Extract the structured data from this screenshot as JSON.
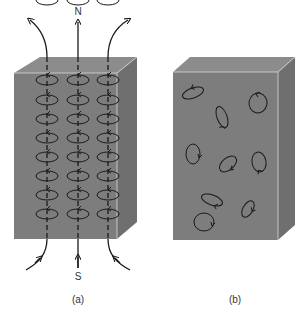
{
  "figure": {
    "panel_a": {
      "caption": "(a)",
      "north_label": "N",
      "south_label": "S",
      "description": "Magnetized material: aligned atomic current loops along field lines",
      "loop_columns": 3,
      "loop_rows": 8
    },
    "panel_b": {
      "caption": "(b)",
      "description": "Unmagnetized material: randomly oriented atomic current loops",
      "loop_count": 10
    },
    "colors": {
      "block_front": "#7d7d7d",
      "block_top": "#8c8c8c",
      "block_side": "#6f6f6f",
      "edge_highlight": "#d8d8d8",
      "lines": "#1a1a1a"
    }
  }
}
